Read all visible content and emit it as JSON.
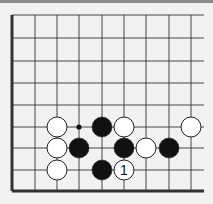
{
  "diagram": {
    "type": "go-board-fragment",
    "board_color": "#f2f2f2",
    "line_color": "#333333",
    "grid": {
      "x": [
        12,
        35,
        57,
        79,
        102,
        124,
        146,
        169,
        191
      ],
      "y": [
        15,
        38,
        61,
        83,
        105,
        127,
        148,
        170,
        191
      ],
      "right_edge_open_to": 204,
      "top_edge_open": true,
      "thick_edges": [
        "left",
        "bottom"
      ]
    },
    "stone_radius": 10,
    "stones": [
      {
        "color": "white",
        "col": 2,
        "row": 5
      },
      {
        "color": "black",
        "col": 4,
        "row": 5
      },
      {
        "color": "white",
        "col": 5,
        "row": 5
      },
      {
        "color": "white",
        "col": 8,
        "row": 5
      },
      {
        "color": "white",
        "col": 2,
        "row": 6
      },
      {
        "color": "black",
        "col": 3,
        "row": 6
      },
      {
        "color": "black",
        "col": 5,
        "row": 6
      },
      {
        "color": "white",
        "col": 6,
        "row": 6
      },
      {
        "color": "black",
        "col": 7,
        "row": 6
      },
      {
        "color": "white",
        "col": 2,
        "row": 7
      },
      {
        "color": "black",
        "col": 4,
        "row": 7
      },
      {
        "color": "white",
        "col": 5,
        "row": 7,
        "label": "1"
      }
    ],
    "markers": [
      {
        "type": "dot",
        "col": 3,
        "row": 5
      }
    ]
  }
}
